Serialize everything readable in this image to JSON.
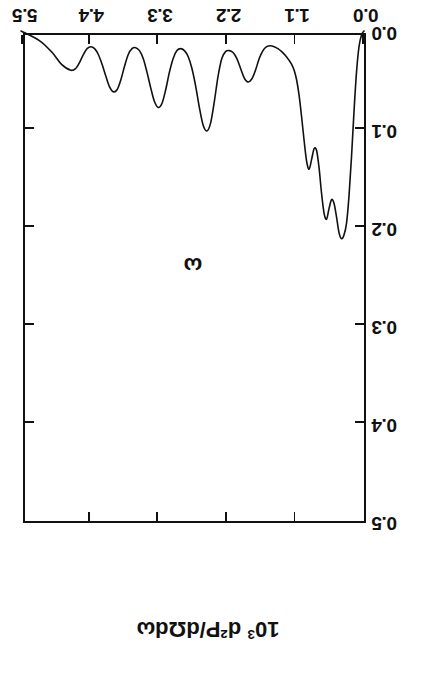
{
  "figure": {
    "orientation_degrees": 180,
    "background_color": "#ffffff",
    "ink_color": "#111111",
    "x_axis_title": "ω",
    "y_axis_title_prefix": "10",
    "y_axis_title_exponent": "3",
    "y_axis_title_rest": " d²P/dΩdω",
    "y_axis_title_plain": "10³ d²P/dΩdω"
  },
  "chart_data": {
    "type": "line",
    "title": "",
    "subtitle": "",
    "xlabel": "ω",
    "ylabel": "10³ d²P/dΩdω",
    "xlim": [
      0.0,
      5.5
    ],
    "ylim": [
      0.0,
      0.5
    ],
    "xticks": [
      0.0,
      1.1,
      2.2,
      3.3,
      4.4,
      5.5
    ],
    "xtick_labels": [
      "0.0",
      "1.1",
      "2.2",
      "3.3",
      "4.4",
      "5.5"
    ],
    "yticks": [
      0.0,
      0.1,
      0.2,
      0.3,
      0.4,
      0.5
    ],
    "ytick_labels": [
      "0.0",
      "0.1",
      "0.2",
      "0.3",
      "0.4",
      "0.5"
    ],
    "grid": false,
    "legend": false,
    "legend_position": "none",
    "tick_direction": "in",
    "ticks_all_sides": true,
    "annotations": [],
    "series": [
      {
        "name": "d2P/dOmega dOmega spectrum",
        "color": "#111111",
        "line_width": 1.6,
        "x": [
          0.0,
          0.04,
          0.08,
          0.12,
          0.16,
          0.2,
          0.24,
          0.28,
          0.32,
          0.36,
          0.4,
          0.44,
          0.48,
          0.52,
          0.56,
          0.6,
          0.64,
          0.68,
          0.72,
          0.76,
          0.8,
          0.84,
          0.88,
          0.92,
          0.96,
          1.0,
          1.04,
          1.08,
          1.12,
          1.16,
          1.2,
          1.26,
          1.32,
          1.38,
          1.44,
          1.5,
          1.56,
          1.62,
          1.68,
          1.74,
          1.8,
          1.86,
          1.92,
          1.98,
          2.04,
          2.1,
          2.16,
          2.22,
          2.28,
          2.34,
          2.4,
          2.46,
          2.52,
          2.58,
          2.64,
          2.7,
          2.76,
          2.82,
          2.88,
          2.94,
          3.0,
          3.06,
          3.12,
          3.18,
          3.24,
          3.3,
          3.36,
          3.42,
          3.48,
          3.54,
          3.6,
          3.66,
          3.72,
          3.78,
          3.84,
          3.9,
          3.96,
          4.02,
          4.08,
          4.14,
          4.2,
          4.26,
          4.32,
          4.38,
          4.44,
          4.5,
          4.56,
          4.62,
          4.7,
          4.85,
          5.0,
          5.2,
          5.5
        ],
        "y": [
          0.0,
          0.004,
          0.016,
          0.042,
          0.082,
          0.128,
          0.168,
          0.196,
          0.208,
          0.212,
          0.206,
          0.19,
          0.176,
          0.172,
          0.181,
          0.192,
          0.186,
          0.166,
          0.14,
          0.122,
          0.12,
          0.131,
          0.141,
          0.133,
          0.112,
          0.088,
          0.066,
          0.05,
          0.04,
          0.034,
          0.03,
          0.025,
          0.021,
          0.018,
          0.016,
          0.015,
          0.016,
          0.02,
          0.028,
          0.04,
          0.049,
          0.052,
          0.048,
          0.038,
          0.028,
          0.022,
          0.02,
          0.021,
          0.028,
          0.046,
          0.072,
          0.094,
          0.102,
          0.096,
          0.078,
          0.056,
          0.038,
          0.026,
          0.02,
          0.018,
          0.02,
          0.028,
          0.042,
          0.06,
          0.074,
          0.078,
          0.072,
          0.058,
          0.042,
          0.028,
          0.02,
          0.017,
          0.018,
          0.024,
          0.036,
          0.05,
          0.06,
          0.062,
          0.057,
          0.046,
          0.034,
          0.024,
          0.018,
          0.016,
          0.018,
          0.024,
          0.032,
          0.038,
          0.04,
          0.034,
          0.022,
          0.01,
          0.0
        ],
        "peaks": [
          {
            "x": 0.36,
            "y": 0.212,
            "label": "main peak"
          },
          {
            "x": 0.6,
            "y": 0.192,
            "label": "shoulder"
          },
          {
            "x": 0.86,
            "y": 0.141,
            "label": "shoulder"
          },
          {
            "x": 1.86,
            "y": 0.052,
            "label": "harmonic"
          },
          {
            "x": 2.52,
            "y": 0.102,
            "label": "harmonic"
          },
          {
            "x": 3.3,
            "y": 0.078,
            "label": "harmonic"
          },
          {
            "x": 4.02,
            "y": 0.062,
            "label": "harmonic"
          },
          {
            "x": 4.7,
            "y": 0.04,
            "label": "harmonic"
          }
        ]
      }
    ]
  }
}
